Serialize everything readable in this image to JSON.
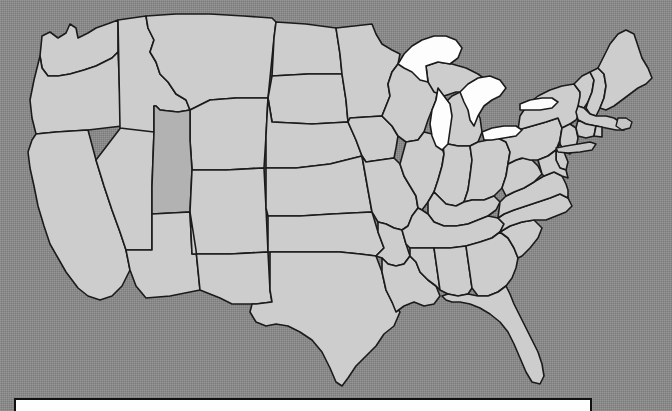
{
  "view": {
    "title": "United States map",
    "width": 672,
    "height": 411,
    "background_color": "#8a8a8a",
    "background_style": "dithered-gray-noise"
  },
  "map": {
    "name": "united-states-states-map",
    "projection_note": "contiguous United States, state outlines only, no labels",
    "colors": {
      "state_fill": "#cdcdcd",
      "state_highlight_fill": "#b2b2b2",
      "state_border": "#1b1b1b",
      "lake_fill": "#fdfdfd",
      "island_fill": "#c6c6c6",
      "ocean_background": "#8a8a8a"
    },
    "highlighted_states": [
      "Utah"
    ],
    "states": [
      "Washington",
      "Oregon",
      "California",
      "Nevada",
      "Idaho",
      "Montana",
      "Wyoming",
      "Utah",
      "Arizona",
      "Colorado",
      "New Mexico",
      "North Dakota",
      "South Dakota",
      "Nebraska",
      "Kansas",
      "Oklahoma",
      "Texas",
      "Minnesota",
      "Iowa",
      "Missouri",
      "Arkansas",
      "Louisiana",
      "Wisconsin",
      "Illinois",
      "Michigan",
      "Indiana",
      "Ohio",
      "Kentucky",
      "Tennessee",
      "Mississippi",
      "Alabama",
      "Georgia",
      "Florida",
      "South Carolina",
      "North Carolina",
      "Virginia",
      "West Virginia",
      "Maryland",
      "Delaware",
      "Pennsylvania",
      "New Jersey",
      "New York",
      "Connecticut",
      "Rhode Island",
      "Massachusetts",
      "Vermont",
      "New Hampshire",
      "Maine"
    ],
    "lakes": [
      "Lake Superior",
      "Lake Michigan",
      "Lake Huron",
      "Lake Erie",
      "Lake Ontario"
    ]
  },
  "bottom_panel": {
    "name": "bottom-panel",
    "text": "",
    "background_color": "#fefefe",
    "border_color": "#101010",
    "note": "white bordered panel cropped by the bottom edge of the screenshot"
  }
}
